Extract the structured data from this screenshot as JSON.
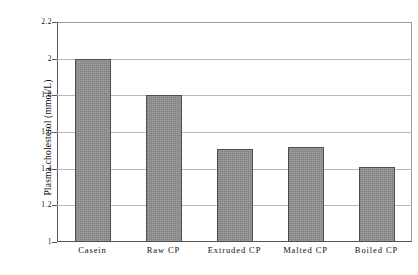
{
  "chart_data": {
    "type": "bar",
    "title": "",
    "xlabel": "",
    "ylabel": "Plasma cholesterol  (mmol/L)",
    "categories": [
      "Casein",
      "Raw CP",
      "Extruded CP",
      "Malted CP",
      "Boiled CP"
    ],
    "values": [
      2.0,
      1.8,
      1.51,
      1.52,
      1.41
    ],
    "ylim": [
      1,
      2.2
    ],
    "ytick_labels": [
      "2.2",
      "2",
      "1.8",
      "1.6",
      "1.4",
      "1.2",
      "1"
    ],
    "ytick_values": [
      2.2,
      2.0,
      1.8,
      1.6,
      1.4,
      1.2,
      1.0
    ],
    "grid": true,
    "legend": false,
    "bar_color": "#8a8a8a",
    "bar_edge_color": "#4e4e52",
    "axis_color": "#55555c",
    "gridline_color": "#b9b9bd",
    "background": "#ffffff"
  }
}
